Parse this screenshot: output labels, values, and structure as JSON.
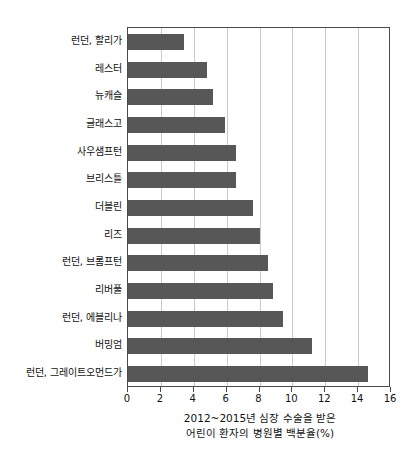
{
  "chart_data": {
    "type": "bar",
    "orientation": "horizontal",
    "title": "",
    "xlabel": "2012~2015년 심장 수술을 받은 어린이 환자의 병원별 백분율(%)",
    "xlabel_lines": [
      "2012~2015년 심장 수술을 받은",
      "어린이 환자의 병원별 백분율(%)"
    ],
    "ylabel": "",
    "categories": [
      "런던, 할리가",
      "레스터",
      "뉴캐슬",
      "글래스고",
      "사우샘프턴",
      "브리스틀",
      "더블린",
      "리즈",
      "런던, 브롬프턴",
      "리버풀",
      "런던, 에블리나",
      "버밍엄",
      "런던, 그레이트오먼드가"
    ],
    "values": [
      3.4,
      4.8,
      5.2,
      5.9,
      6.6,
      6.6,
      7.6,
      8.0,
      8.5,
      8.8,
      9.4,
      11.2,
      14.6
    ],
    "xlim": [
      0,
      16
    ],
    "xticks": [
      0,
      2,
      4,
      6,
      8,
      10,
      12,
      14,
      16
    ],
    "xtick_labels": [
      "0",
      "2",
      "4",
      "6",
      "8",
      "10",
      "12",
      "14",
      "16"
    ],
    "grid": "vertical",
    "legend": "none",
    "bar_color": "#575757",
    "grid_color": "#c9c9c9",
    "axis_color": "#4a4a4a"
  }
}
